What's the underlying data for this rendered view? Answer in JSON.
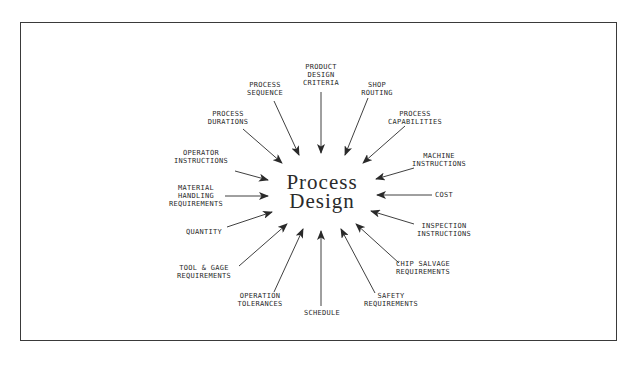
{
  "diagram": {
    "center": {
      "line1": "Process",
      "line2": "Design"
    },
    "inputs": [
      {
        "id": "product-design-criteria",
        "lines": [
          "PRODUCT",
          "DESIGN",
          "CRITERIA"
        ]
      },
      {
        "id": "shop-routing",
        "lines": [
          "SHOP",
          "ROUTING"
        ]
      },
      {
        "id": "process-capabilities",
        "lines": [
          "PROCESS",
          "CAPABILITIES"
        ]
      },
      {
        "id": "machine-instructions",
        "lines": [
          "MACHINE",
          "INSTRUCTIONS"
        ]
      },
      {
        "id": "cost",
        "lines": [
          "COST"
        ]
      },
      {
        "id": "inspection-instructions",
        "lines": [
          "INSPECTION",
          "INSTRUCTIONS"
        ]
      },
      {
        "id": "chip-salvage-requirements",
        "lines": [
          "CHIP SALVAGE",
          "REQUIREMENTS"
        ]
      },
      {
        "id": "safety-requirements",
        "lines": [
          "SAFETY",
          "REQUIREMENTS"
        ]
      },
      {
        "id": "schedule",
        "lines": [
          "SCHEDULE"
        ]
      },
      {
        "id": "operation-tolerances",
        "lines": [
          "OPERATION",
          "TOLERANCES"
        ]
      },
      {
        "id": "tool-gage-requirements",
        "lines": [
          "TOOL & GAGE",
          "REQUIREMENTS"
        ]
      },
      {
        "id": "quantity",
        "lines": [
          "QUANTITY"
        ]
      },
      {
        "id": "material-handling-requirements",
        "lines": [
          "MATERIAL",
          "HANDLING",
          "REQUIREMENTS"
        ]
      },
      {
        "id": "operator-instructions",
        "lines": [
          "OPERATOR",
          "INSTRUCTIONS"
        ]
      },
      {
        "id": "process-durations",
        "lines": [
          "PROCESS",
          "DURATIONS"
        ]
      },
      {
        "id": "process-sequence",
        "lines": [
          "PROCESS",
          "SEQUENCE"
        ]
      }
    ]
  },
  "colors": {
    "line": "#2a2a2a",
    "frame": "#3a3a3a",
    "background": "#ffffff"
  }
}
